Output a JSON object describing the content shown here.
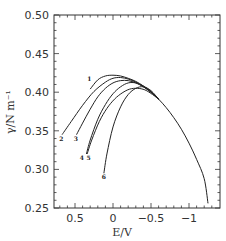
{
  "chart_data": {
    "type": "line",
    "title": "",
    "xlabel": "E/V",
    "ylabel": "γ/N m⁻¹",
    "xlim": [
      0.75,
      -1.3
    ],
    "ylim": [
      0.25,
      0.5
    ],
    "x_reversed": true,
    "grid": false,
    "legend": "none (curves labeled inline 1–6)",
    "xticks": [
      {
        "value": 0.5,
        "label": "0.5"
      },
      {
        "value": 0,
        "label": "0"
      },
      {
        "value": -0.5,
        "label": "−0.5"
      },
      {
        "value": -1,
        "label": "−1"
      }
    ],
    "yticks": [
      {
        "value": 0.5,
        "label": "0.50"
      },
      {
        "value": 0.45,
        "label": "0.45"
      },
      {
        "value": 0.4,
        "label": "0.40"
      },
      {
        "value": 0.35,
        "label": "0.35"
      },
      {
        "value": 0.3,
        "label": "0.30"
      },
      {
        "value": 0.25,
        "label": "0.25"
      }
    ],
    "series": [
      {
        "name": "1",
        "x": [
          0.3,
          0.2,
          0.1,
          0.0,
          -0.1,
          -0.2,
          -0.3,
          -0.4,
          -0.5,
          -0.6,
          -0.7,
          -0.8,
          -0.9,
          -1.0,
          -1.1,
          -1.2,
          -1.25
        ],
        "y": [
          0.404,
          0.416,
          0.421,
          0.422,
          0.421,
          0.418,
          0.414,
          0.408,
          0.4,
          0.391,
          0.38,
          0.367,
          0.352,
          0.334,
          0.313,
          0.288,
          0.256
        ]
      },
      {
        "name": "2",
        "x": [
          0.67,
          0.55,
          0.4,
          0.25,
          0.1,
          0.0,
          -0.1,
          -0.2,
          -0.3,
          -0.4,
          -0.5,
          -0.6
        ],
        "y": [
          0.345,
          0.362,
          0.383,
          0.401,
          0.413,
          0.418,
          0.419,
          0.417,
          0.413,
          0.407,
          0.4,
          0.391
        ]
      },
      {
        "name": "3",
        "x": [
          0.48,
          0.4,
          0.3,
          0.2,
          0.1,
          0.0,
          -0.1,
          -0.2,
          -0.3,
          -0.4,
          -0.5,
          -0.6
        ],
        "y": [
          0.345,
          0.36,
          0.378,
          0.394,
          0.405,
          0.412,
          0.415,
          0.415,
          0.412,
          0.407,
          0.4,
          0.391
        ]
      },
      {
        "name": "4",
        "x": [
          0.35,
          0.3,
          0.2,
          0.1,
          0.0,
          -0.1,
          -0.2,
          -0.3,
          -0.4,
          -0.5,
          -0.6
        ],
        "y": [
          0.32,
          0.338,
          0.365,
          0.384,
          0.398,
          0.407,
          0.412,
          0.412,
          0.408,
          0.401,
          0.391
        ]
      },
      {
        "name": "5",
        "x": [
          0.34,
          0.28,
          0.18,
          0.08,
          -0.02,
          -0.12,
          -0.22,
          -0.32,
          -0.42,
          -0.52,
          -0.6
        ],
        "y": [
          0.32,
          0.338,
          0.362,
          0.379,
          0.391,
          0.399,
          0.404,
          0.405,
          0.403,
          0.397,
          0.391
        ]
      },
      {
        "name": "6",
        "x": [
          0.12,
          0.08,
          0.0,
          -0.1,
          -0.2,
          -0.3,
          -0.4,
          -0.5,
          -0.6
        ],
        "y": [
          0.295,
          0.32,
          0.355,
          0.381,
          0.397,
          0.405,
          0.407,
          0.402,
          0.391
        ]
      }
    ],
    "curve_labels": [
      {
        "text": "1",
        "x": 0.31,
        "y": 0.415
      },
      {
        "text": "2",
        "x": 0.68,
        "y": 0.337
      },
      {
        "text": "3",
        "x": 0.49,
        "y": 0.337
      },
      {
        "text": "4",
        "x": 0.41,
        "y": 0.312
      },
      {
        "text": "5",
        "x": 0.32,
        "y": 0.312
      },
      {
        "text": "6",
        "x": 0.12,
        "y": 0.287
      }
    ]
  }
}
